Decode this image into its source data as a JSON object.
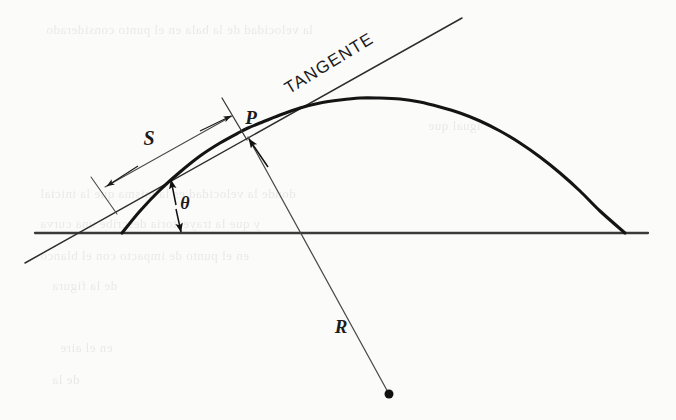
{
  "figure": {
    "kind": "projectile-trajectory-geometry-diagram",
    "caption_text": "",
    "background_color": "#fbfbfa",
    "ink_color": "#1b1b1b",
    "thin_line_color": "#4a4a4a"
  },
  "labels": {
    "tangente": "TANGENTE",
    "arc_length": "S",
    "point": "P",
    "angle": "θ",
    "radius": "R"
  },
  "chart_data": {
    "type": "line",
    "title": "",
    "subtitle": "",
    "xlabel": "",
    "ylabel": "",
    "grid": false,
    "legend_position": "none",
    "xlim": [
      0,
      676
    ],
    "ylim": [
      420,
      0
    ],
    "annotations": [
      {
        "name": "tangente",
        "text": "TANGENTE",
        "x": 332,
        "y": 68,
        "rotation_deg": -31.5
      },
      {
        "name": "arc-length",
        "text": "S",
        "x": 149,
        "y": 145,
        "rotation_deg": 0
      },
      {
        "name": "point-p",
        "text": "P",
        "x": 251,
        "y": 124,
        "rotation_deg": 0
      },
      {
        "name": "launch-angle",
        "text": "θ",
        "x": 185,
        "y": 209,
        "rotation_deg": 0
      },
      {
        "name": "radius-r",
        "text": "R",
        "x": 341,
        "y": 333,
        "rotation_deg": 0
      }
    ],
    "series": [
      {
        "name": "ground-line",
        "type": "line",
        "points": [
          [
            35,
            233
          ],
          [
            648,
            233
          ]
        ]
      },
      {
        "name": "trajectory-parabola",
        "type": "line",
        "points": [
          [
            122,
            233
          ],
          [
            140,
            211
          ],
          [
            160,
            190
          ],
          [
            180,
            172
          ],
          [
            200,
            156
          ],
          [
            220,
            143
          ],
          [
            240,
            132
          ],
          [
            248,
            128
          ],
          [
            260,
            123
          ],
          [
            280,
            115
          ],
          [
            300,
            108
          ],
          [
            320,
            103
          ],
          [
            340,
            100
          ],
          [
            360,
            98
          ],
          [
            378,
            98
          ],
          [
            400,
            99
          ],
          [
            420,
            102
          ],
          [
            440,
            107
          ],
          [
            460,
            113
          ],
          [
            480,
            121
          ],
          [
            500,
            131
          ],
          [
            520,
            143
          ],
          [
            540,
            157
          ],
          [
            560,
            173
          ],
          [
            580,
            191
          ],
          [
            600,
            211
          ],
          [
            625,
            233
          ]
        ]
      },
      {
        "name": "tangent-line",
        "type": "line",
        "points": [
          [
            25,
            263
          ],
          [
            462,
            18
          ]
        ]
      },
      {
        "name": "radius-normal-line",
        "type": "line",
        "points": [
          [
            248,
            137
          ],
          [
            389,
            394
          ]
        ]
      },
      {
        "name": "arc-length-dimension-line",
        "type": "line",
        "points": [
          [
            105,
            187
          ],
          [
            232,
            116
          ]
        ]
      },
      {
        "name": "extension-tick-left",
        "type": "line",
        "points": [
          [
            91,
            177
          ],
          [
            117,
            214
          ]
        ]
      },
      {
        "name": "extension-tick-right",
        "type": "line",
        "points": [
          [
            222,
            98
          ],
          [
            247,
            140
          ]
        ]
      },
      {
        "name": "angle-indicator-line",
        "type": "line",
        "points": [
          [
            172,
            181
          ],
          [
            180,
            233
          ]
        ]
      }
    ],
    "markers": [
      {
        "name": "center-of-curvature-dot",
        "x": 389,
        "y": 394,
        "r": 4.5,
        "filled": true
      },
      {
        "name": "point-p-marker",
        "x": 248,
        "y": 137,
        "r": 0,
        "filled": false
      }
    ],
    "arrows": [
      {
        "name": "arc-arrow-right",
        "from": [
          200,
          131
        ],
        "to": [
          231,
          116
        ]
      },
      {
        "name": "arc-arrow-left",
        "from": [
          138,
          166
        ],
        "to": [
          107,
          186
        ]
      },
      {
        "name": "radius-arrow-at-p",
        "from": [
          268,
          167
        ],
        "to": [
          249,
          139
        ]
      },
      {
        "name": "angle-arrow-up",
        "from": [
          176,
          205
        ],
        "to": [
          171,
          180
        ]
      },
      {
        "name": "angle-arrow-down",
        "from": [
          176,
          209
        ],
        "to": [
          181,
          232
        ]
      }
    ]
  },
  "ghost_text": {
    "note": "faint show-through text from reverse of scanned page",
    "lines": [
      {
        "text": "la velocidad de la bala en el punto considerado",
        "x": 46,
        "y": 22,
        "size": 13
      },
      {
        "text": "igual que",
        "x": 428,
        "y": 118,
        "size": 13
      },
      {
        "text": "donde la velocidad es la misma que la inicial",
        "x": 40,
        "y": 186,
        "size": 13
      },
      {
        "text": "y que la trayectoria describe una curva",
        "x": 40,
        "y": 216,
        "size": 13
      },
      {
        "text": "en el punto de impacto con el blanco",
        "x": 40,
        "y": 248,
        "size": 13
      },
      {
        "text": "de la figura",
        "x": 52,
        "y": 278,
        "size": 13
      },
      {
        "text": "en el aire",
        "x": 60,
        "y": 340,
        "size": 13
      },
      {
        "text": "de la",
        "x": 52,
        "y": 372,
        "size": 13
      }
    ]
  }
}
